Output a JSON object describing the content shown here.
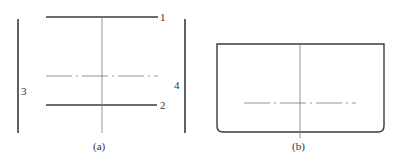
{
  "figure_a": {
    "caption": "(a)",
    "labels": {
      "line1": "1",
      "line2": "2",
      "line3": "3",
      "line4": "4"
    }
  },
  "figure_b": {
    "caption": "(b)"
  },
  "colors": {
    "line_dark": "#3a3a3a",
    "line_light": "#7a7a7a",
    "background": "#ffffff"
  }
}
